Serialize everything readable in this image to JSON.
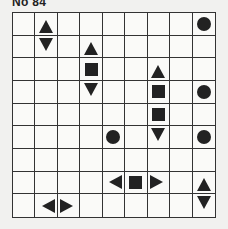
{
  "puzzle": {
    "title": "No 84",
    "rows": 9,
    "cols": 9,
    "colors": {
      "shape": "#222222",
      "grid_line": "#333333",
      "background": "#f1f1ef",
      "cell": "#fafaf8"
    },
    "shape_legend": {
      "circle": "single-cell ship (submarine)",
      "square": "ship middle segment",
      "up": "ship end pointing up",
      "down": "ship end pointing down",
      "left": "ship end pointing left",
      "right": "ship end pointing right"
    },
    "cells": [
      {
        "row": 0,
        "col": 1,
        "shape": "up"
      },
      {
        "row": 0,
        "col": 8,
        "shape": "circle"
      },
      {
        "row": 1,
        "col": 1,
        "shape": "down"
      },
      {
        "row": 1,
        "col": 3,
        "shape": "up"
      },
      {
        "row": 2,
        "col": 3,
        "shape": "square"
      },
      {
        "row": 2,
        "col": 6,
        "shape": "up"
      },
      {
        "row": 3,
        "col": 3,
        "shape": "down"
      },
      {
        "row": 3,
        "col": 6,
        "shape": "square"
      },
      {
        "row": 3,
        "col": 8,
        "shape": "circle"
      },
      {
        "row": 4,
        "col": 6,
        "shape": "square"
      },
      {
        "row": 5,
        "col": 4,
        "shape": "circle"
      },
      {
        "row": 5,
        "col": 6,
        "shape": "down"
      },
      {
        "row": 5,
        "col": 8,
        "shape": "circle"
      },
      {
        "row": 7,
        "col": 4,
        "shape": "left"
      },
      {
        "row": 7,
        "col": 5,
        "shape": "square"
      },
      {
        "row": 7,
        "col": 6,
        "shape": "right"
      },
      {
        "row": 7,
        "col": 8,
        "shape": "up"
      },
      {
        "row": 8,
        "col": 1,
        "shape": "left"
      },
      {
        "row": 8,
        "col": 2,
        "shape": "right"
      },
      {
        "row": 8,
        "col": 8,
        "shape": "down"
      }
    ]
  }
}
